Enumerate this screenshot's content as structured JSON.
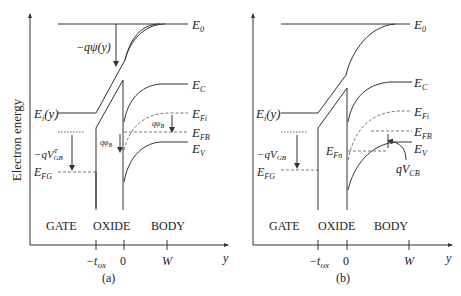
{
  "y_axis_label": "Electron energy",
  "x_axis_label": "y",
  "panels": [
    {
      "caption": "(a)",
      "labels": {
        "E0": "E",
        "E0_sub": "0",
        "EC": "E",
        "EC_sub": "C",
        "EFi": "E",
        "EFi_sub": "Fi",
        "EFB": "E",
        "EFB_sub": "FB",
        "EV": "E",
        "EV_sub": "V",
        "Ei": "E",
        "Ei_sub": "i",
        "Ei_arg": "(y)",
        "EFG": "E",
        "EFG_sub": "FG",
        "psi": "−qψ(y)",
        "vgb": "−qV",
        "vgb_sub": "GB",
        "vgb_sup": "T",
        "phiB1": "qφ",
        "phiB1_sub": "B",
        "phiB2": "qφ",
        "phiB2_sub": "B"
      },
      "regions": [
        "GATE",
        "OXIDE",
        "BODY"
      ],
      "ticks": {
        "tox": "−t",
        "tox_sub": "ox",
        "zero": "0",
        "W": "W"
      }
    },
    {
      "caption": "(b)",
      "labels": {
        "E0": "E",
        "E0_sub": "0",
        "EC": "E",
        "EC_sub": "C",
        "EFi": "E",
        "EFi_sub": "Fi",
        "EFB": "E",
        "EFB_sub": "FB",
        "EV": "E",
        "EV_sub": "V",
        "Ei": "E",
        "Ei_sub": "i",
        "Ei_arg": "(y)",
        "EFG": "E",
        "EFG_sub": "FG",
        "EFn": "E",
        "EFn_sub": "Fn",
        "vgb": "−qV",
        "vgb_sub": "GB",
        "vcb": "qV",
        "vcb_sub": "CB"
      },
      "regions": [
        "GATE",
        "OXIDE",
        "BODY"
      ],
      "ticks": {
        "tox": "−t",
        "tox_sub": "ox",
        "zero": "0",
        "W": "W"
      }
    }
  ]
}
